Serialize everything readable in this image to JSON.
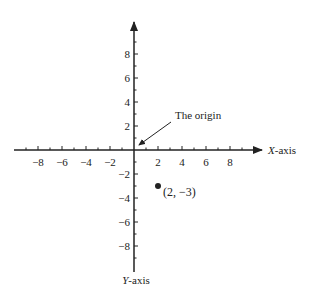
{
  "diagram": {
    "x_axis_label_var": "X",
    "x_axis_label_suffix": "-axis",
    "y_axis_label_var": "Y",
    "y_axis_label_suffix": "-axis",
    "origin_label": "The origin",
    "point_label": "(2, −3)",
    "x_ticks": [
      "−8",
      "−6",
      "−4",
      "−2",
      "2",
      "4",
      "6",
      "8"
    ],
    "y_ticks": [
      "8",
      "6",
      "4",
      "2",
      "−2",
      "−4",
      "−6",
      "−8"
    ]
  },
  "chart_data": {
    "type": "scatter",
    "title": "",
    "xlabel": "X-axis",
    "ylabel": "Y-axis",
    "xlim": [
      -10,
      10
    ],
    "ylim": [
      -10,
      10
    ],
    "x_tick_labels": [
      -8,
      -6,
      -4,
      -2,
      2,
      4,
      6,
      8
    ],
    "y_tick_labels": [
      8,
      6,
      4,
      2,
      -2,
      -4,
      -6,
      -8
    ],
    "points": [
      {
        "x": 2,
        "y": -3,
        "label": "(2, -3)"
      }
    ],
    "annotations": [
      {
        "text": "The origin",
        "points_to": [
          0,
          0
        ]
      }
    ],
    "grid": false
  }
}
